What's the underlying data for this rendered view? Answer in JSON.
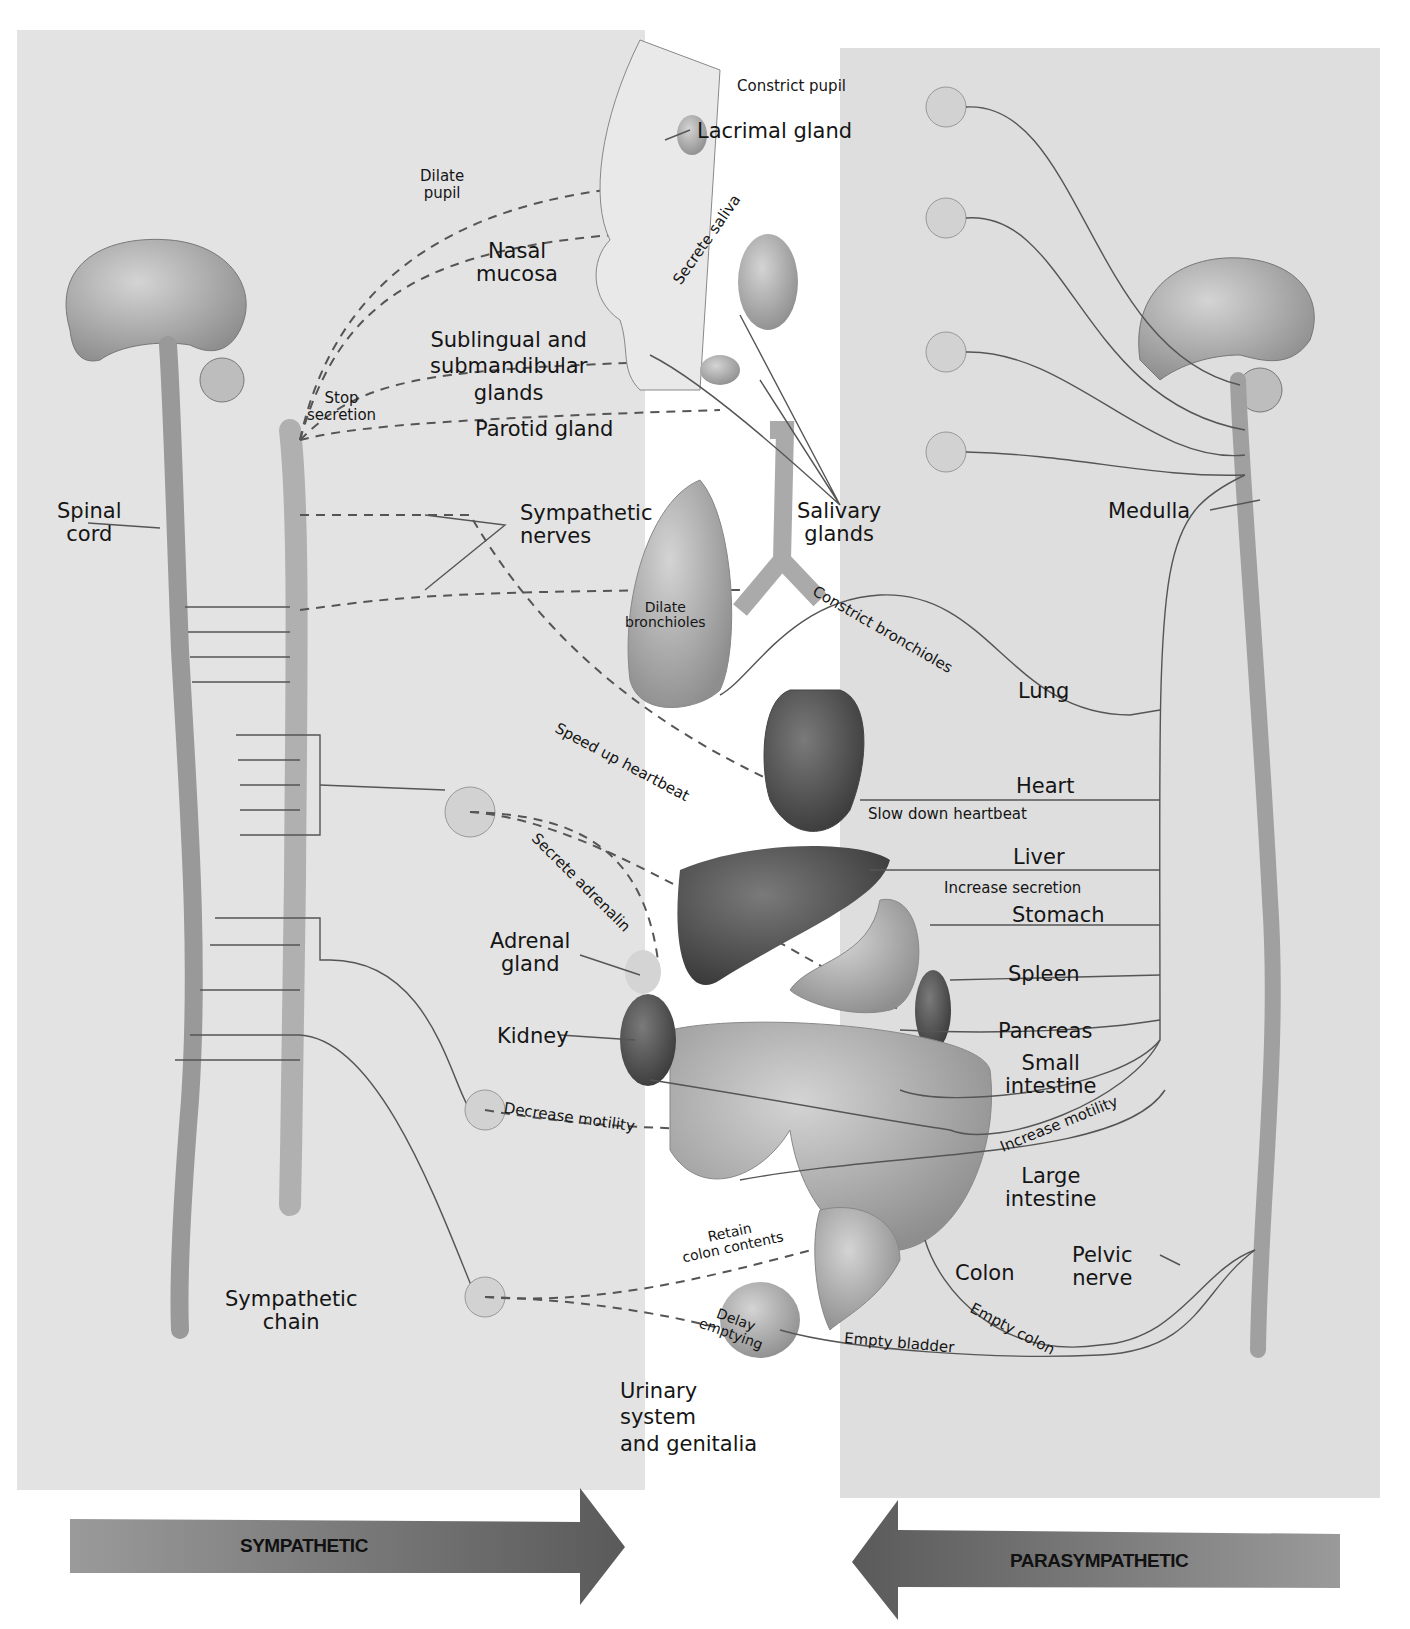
{
  "panels": {
    "left": "sympathetic",
    "right": "parasympathetic"
  },
  "left_labels": {
    "spinal_cord": [
      "Spinal",
      "cord"
    ],
    "sympathetic_chain": [
      "Sympathetic",
      "chain"
    ],
    "sympathetic_nerves": [
      "Sympathetic",
      "nerves"
    ],
    "stop_secretion": [
      "Stop",
      "secretion"
    ],
    "dilate_pupil": [
      "Dilate",
      "pupil"
    ],
    "nasal_mucosa": [
      "Nasal",
      "mucosa"
    ],
    "sublingual": [
      "Sublingual and",
      "submandibular",
      "glands"
    ],
    "parotid": "Parotid gland",
    "dilate_bronchioles": [
      "Dilate",
      "bronchioles"
    ],
    "speed_up_heartbeat": "Speed up heartbeat",
    "secrete_adrenalin": "Secrete adrenalin",
    "adrenal_gland": [
      "Adrenal",
      "gland"
    ],
    "kidney": "Kidney",
    "decrease_motility": "Decrease motility",
    "retain_colon": [
      "Retain",
      "colon contents"
    ],
    "delay_emptying": [
      "Delay",
      "emptying"
    ],
    "urinary": [
      "Urinary",
      "system",
      "and genitalia"
    ]
  },
  "right_labels": {
    "constrict_pupil": "Constrict pupil",
    "lacrimal_gland": "Lacrimal gland",
    "secrete_saliva": "Secrete saliva",
    "salivary_glands": [
      "Salivary",
      "glands"
    ],
    "medulla": "Medulla",
    "constrict_bronchioles": "Constrict bronchioles",
    "lung": "Lung",
    "heart": "Heart",
    "slow_down_heartbeat": "Slow down heartbeat",
    "liver": "Liver",
    "increase_secretion": "Increase secretion",
    "stomach": "Stomach",
    "spleen": "Spleen",
    "pancreas": "Pancreas",
    "small_intestine": [
      "Small",
      "intestine"
    ],
    "increase_motility": "Increase motility",
    "large_intestine": [
      "Large",
      "intestine"
    ],
    "colon": "Colon",
    "pelvic_nerve": [
      "Pelvic",
      "nerve"
    ],
    "empty_colon": "Empty colon",
    "empty_bladder": "Empty bladder"
  },
  "arrows": {
    "sympathetic": "SYMPATHETIC",
    "parasympathetic": "PARASYMPATHETIC"
  },
  "colors": {
    "panel_bg": "#e0e0e0",
    "organ_light": "#b8b8b8",
    "organ_dark": "#555555",
    "arrow_fill": "#6e6e6e",
    "nerve_line": "#444444"
  }
}
